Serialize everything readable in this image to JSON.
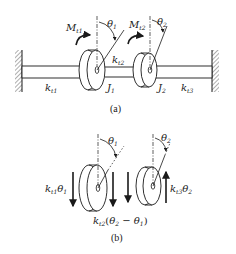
{
  "figure": {
    "subfigure_a": {
      "caption": "(a)",
      "moments": [
        {
          "symbol": "M",
          "subscript": "t1"
        },
        {
          "symbol": "M",
          "subscript": "t2"
        }
      ],
      "angles": [
        {
          "symbol": "θ",
          "subscript": "1"
        },
        {
          "symbol": "θ",
          "subscript": "2"
        }
      ],
      "stiffness": [
        {
          "symbol": "k",
          "subscript": "t1"
        },
        {
          "symbol": "k",
          "subscript": "t2"
        },
        {
          "symbol": "k",
          "subscript": "t3"
        }
      ],
      "inertias": [
        {
          "symbol": "J",
          "subscript": "1"
        },
        {
          "symbol": "J",
          "subscript": "2"
        }
      ]
    },
    "subfigure_b": {
      "caption": "(b)",
      "angles": [
        {
          "symbol": "θ",
          "subscript": "1"
        },
        {
          "symbol": "θ",
          "subscript": "2"
        }
      ],
      "torques": [
        {
          "k": "k",
          "ksub": "t1",
          "theta": "θ",
          "thsub": "1"
        },
        {
          "k": "k",
          "ksub": "t3",
          "theta": "θ",
          "thsub": "2"
        },
        {
          "k": "k",
          "ksub": "t2",
          "expr_open": "(",
          "th2": "θ",
          "th2sub": "2",
          "minus": " − ",
          "th1": "θ",
          "th1sub": "1",
          "expr_close": ")"
        }
      ]
    }
  },
  "colors": {
    "ink": "#1a1a1a",
    "background": "#ffffff"
  }
}
